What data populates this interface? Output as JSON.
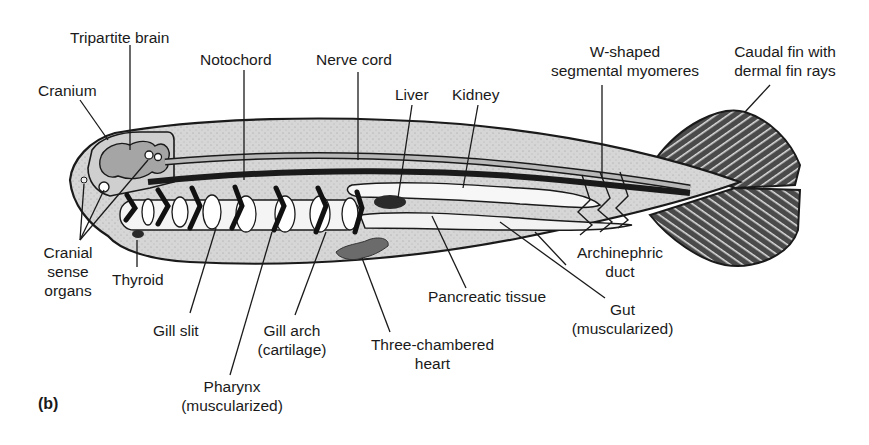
{
  "figure": {
    "panel_label": "(b)",
    "colors": {
      "body_fill": "#d9d9d9",
      "outline": "#1a1a1a",
      "gut_fill": "#f7f7f7",
      "heart_fill": "#6e6e6e",
      "notochord": "#222222",
      "nerve_cord": "#b5b5b5",
      "fin_fill": "#5a5a5a"
    }
  },
  "labels": {
    "tripartite_brain": "Tripartite brain",
    "cranium": "Cranium",
    "notochord": "Notochord",
    "nerve_cord": "Nerve cord",
    "liver": "Liver",
    "kidney": "Kidney",
    "myomeres_line1": "W-shaped",
    "myomeres_line2": "segmental myomeres",
    "caudal_line1": "Caudal fin with",
    "caudal_line2": "dermal fin rays",
    "cranial_line1": "Cranial",
    "cranial_line2": "sense",
    "cranial_line3": "organs",
    "thyroid": "Thyroid",
    "gill_slit": "Gill slit",
    "gill_arch_line1": "Gill arch",
    "gill_arch_line2": "(cartilage)",
    "pharynx_line1": "Pharynx",
    "pharynx_line2": "(muscularized)",
    "heart_line1": "Three-chambered",
    "heart_line2": "heart",
    "pancreatic": "Pancreatic tissue",
    "archinephric_line1": "Archinephric",
    "archinephric_line2": "duct",
    "gut_line1": "Gut",
    "gut_line2": "(muscularized)"
  }
}
